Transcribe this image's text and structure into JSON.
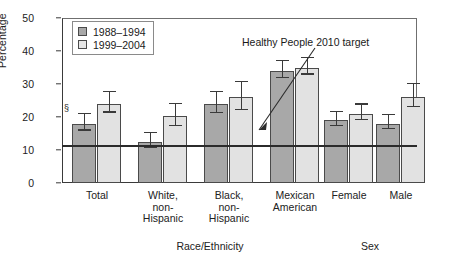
{
  "chart_data": {
    "type": "bar",
    "title": "",
    "xlabel": "",
    "ylabel": "Percentage",
    "ylim": [
      0,
      50
    ],
    "yticks": [
      0,
      10,
      20,
      30,
      40,
      50
    ],
    "grid": false,
    "legend_position": "top-left",
    "categories": [
      "Total",
      "White, non-Hispanic",
      "Black, non-Hispanic",
      "Mexican American",
      "Female",
      "Male"
    ],
    "category_label_lines": [
      [
        "Total"
      ],
      [
        "White,",
        "non-",
        "Hispanic"
      ],
      [
        "Black,",
        "non-",
        "Hispanic"
      ],
      [
        "Mexican",
        "American"
      ],
      [
        "Female"
      ],
      [
        "Male"
      ]
    ],
    "group_axis_titles": [
      {
        "text": "Race/Ethnicity",
        "spans": [
          "Total",
          "White, non-Hispanic",
          "Black, non-Hispanic",
          "Mexican American"
        ]
      },
      {
        "text": "Sex",
        "spans": [
          "Female",
          "Male"
        ]
      }
    ],
    "series": [
      {
        "name": "1988–1994",
        "color": "#a8a8a8",
        "values": [
          18.0,
          12.5,
          24.0,
          34.0,
          19.0,
          18.0
        ],
        "err_low": [
          15.5,
          10.2,
          20.8,
          31.5,
          17.0,
          16.0
        ],
        "err_high": [
          20.5,
          14.8,
          27.2,
          36.6,
          21.2,
          20.2
        ]
      },
      {
        "name": "1999–2004",
        "color": "#e2e2e2",
        "values": [
          24.0,
          20.2,
          26.0,
          35.0,
          21.0,
          26.0
        ],
        "err_low": [
          21.0,
          17.0,
          21.8,
          32.5,
          18.8,
          22.6
        ],
        "err_high": [
          27.2,
          23.5,
          30.2,
          37.6,
          23.4,
          29.6
        ]
      }
    ],
    "annotations": [
      {
        "name": "target-line",
        "text": "Healthy People 2010 target",
        "value": 11.5,
        "kind": "horizontal-reference-line"
      },
      {
        "name": "significance-marker",
        "text": "§",
        "attached_to": {
          "category": "Total",
          "series": "1988–1994"
        }
      }
    ]
  },
  "legend": {
    "items": [
      {
        "label": "1988–1994",
        "color": "#a8a8a8"
      },
      {
        "label": "1999–2004",
        "color": "#e6e6e6"
      }
    ]
  },
  "axes": {
    "y_title": "Percentage",
    "y_ticks": [
      "50",
      "40",
      "30",
      "20",
      "10",
      "0"
    ],
    "x_group_titles": [
      "Race/Ethnicity",
      "Sex"
    ]
  },
  "annotation": {
    "target_text": "Healthy People 2010 target",
    "significance_symbol": "§"
  }
}
